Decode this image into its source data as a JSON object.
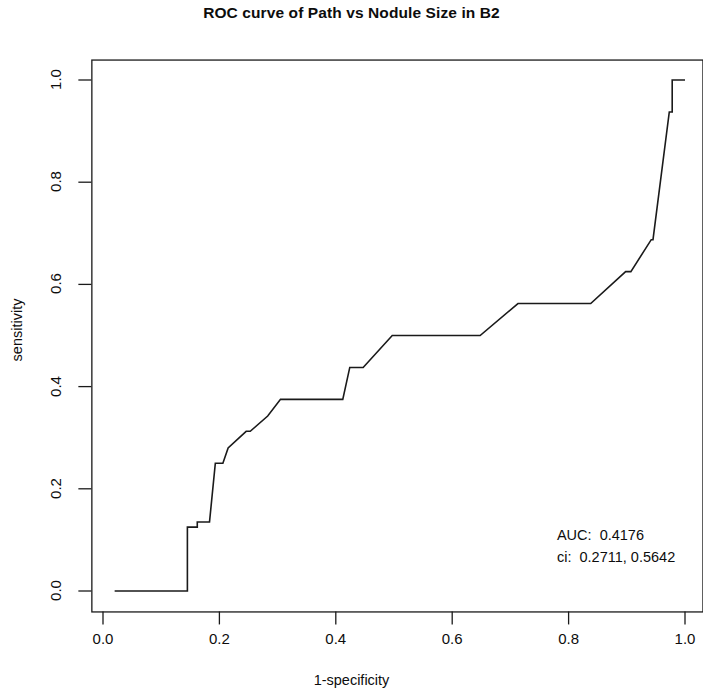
{
  "chart_data": {
    "type": "line",
    "title": "ROC curve of Path vs Nodule Size in B2",
    "xlabel": "1-specificity",
    "ylabel": "sensitivity",
    "xlim": [
      -0.02,
      1.03
    ],
    "ylim": [
      -0.04,
      1.04
    ],
    "grid": false,
    "legend": "none",
    "xticks": [
      0.0,
      0.2,
      0.4,
      0.6,
      0.8,
      1.0
    ],
    "xtick_labels": [
      "0.0",
      "0.2",
      "0.4",
      "0.6",
      "0.8",
      "1.0"
    ],
    "yticks": [
      0.0,
      0.2,
      0.4,
      0.6,
      0.8,
      1.0
    ],
    "ytick_labels": [
      "0.0",
      "0.2",
      "0.4",
      "0.6",
      "0.8",
      "1.0"
    ],
    "series": [
      {
        "name": "ROC curve",
        "color": "#1a1a1a",
        "x": [
          0.02,
          0.145,
          0.145,
          0.162,
          0.162,
          0.183,
          0.193,
          0.206,
          0.215,
          0.246,
          0.253,
          0.283,
          0.305,
          0.335,
          0.412,
          0.424,
          0.447,
          0.497,
          0.497,
          0.648,
          0.648,
          0.713,
          0.713,
          0.838,
          0.838,
          0.898,
          0.907,
          0.907,
          0.942,
          0.945,
          0.945,
          0.973,
          0.978,
          0.978,
          1.0
        ],
        "y": [
          0.0,
          0.0,
          0.125,
          0.125,
          0.135,
          0.135,
          0.25,
          0.25,
          0.28,
          0.3125,
          0.3125,
          0.3425,
          0.375,
          0.375,
          0.375,
          0.4375,
          0.4375,
          0.5,
          0.5,
          0.5,
          0.5,
          0.5625,
          0.5625,
          0.5625,
          0.5625,
          0.625,
          0.625,
          0.625,
          0.6875,
          0.6875,
          0.6875,
          0.9375,
          0.9375,
          1.0,
          1.0
        ]
      }
    ],
    "annotations": [
      {
        "id": "auc",
        "text": "AUC:  0.4176",
        "x": 0.78,
        "y": 0.105
      },
      {
        "id": "ci",
        "text": "ci:  0.2711, 0.5642",
        "x": 0.78,
        "y": 0.063
      }
    ],
    "auc": 0.4176,
    "ci_lower": 0.2711,
    "ci_upper": 0.5642
  },
  "labels": {
    "title": "ROC curve of Path vs Nodule Size in B2",
    "xlabel": "1-specificity",
    "ylabel": "sensitivity",
    "x_ticks": [
      "0.0",
      "0.2",
      "0.4",
      "0.6",
      "0.8",
      "1.0"
    ],
    "y_ticks": [
      "0.0",
      "0.2",
      "0.4",
      "0.6",
      "0.8",
      "1.0"
    ],
    "auc_text": "AUC:  0.4176",
    "ci_text": "ci:  0.2711, 0.5642"
  }
}
